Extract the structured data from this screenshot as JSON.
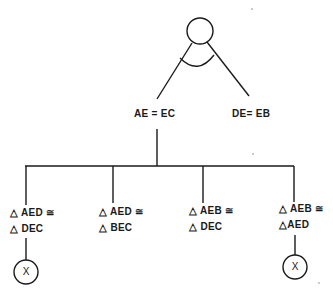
{
  "diagram": {
    "type": "proof-tree",
    "line_color": "#1a1a1a",
    "root": {
      "shape": "circle",
      "has_arc": true
    },
    "level1": [
      {
        "id": "n1",
        "label": "AE = EC"
      },
      {
        "id": "n2",
        "label": "DE= EB"
      }
    ],
    "level2": [
      {
        "id": "c1",
        "line1": "△ AED ≅",
        "line2": "△ DEC",
        "terminal": "X"
      },
      {
        "id": "c2",
        "line1": "△ AED ≅",
        "line2": "△ BEC",
        "terminal": null
      },
      {
        "id": "c3",
        "line1": "△ AEB ≅",
        "line2": "△ DEC",
        "terminal": null
      },
      {
        "id": "c4",
        "line1": "△ AEB ≅",
        "line2": "△AED",
        "terminal": "X"
      }
    ]
  }
}
